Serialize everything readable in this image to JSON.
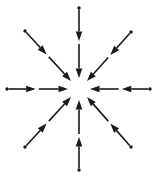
{
  "figure": {
    "width": 156,
    "height": 178,
    "background_color": "#ffffff",
    "stroke_color": "#1a1a1a",
    "arrow_count": 8
  },
  "chart_data": {
    "type": "diagram",
    "center": {
      "x": 79,
      "y": 89
    },
    "arrow_structure": {
      "tail_marker": "dot",
      "mid_shaft_arrowhead": true,
      "shaft_gap_after_mid_head": true,
      "terminal_arrowhead_at_center": true,
      "direction": "inward"
    },
    "arrows": [
      {
        "name": "arrow-north",
        "label": "N",
        "angle_deg": 90,
        "tail": {
          "x": 79,
          "y": 8
        },
        "tip": {
          "x": 79,
          "y": 78
        },
        "mid_head_t": 0.47
      },
      {
        "name": "arrow-northeast",
        "label": "NE",
        "angle_deg": 45,
        "tail": {
          "x": 131,
          "y": 32
        },
        "tip": {
          "x": 87,
          "y": 81
        },
        "mid_head_t": 0.47
      },
      {
        "name": "arrow-east",
        "label": "E",
        "angle_deg": 0,
        "tail": {
          "x": 150,
          "y": 89
        },
        "tip": {
          "x": 90,
          "y": 89
        },
        "mid_head_t": 0.47
      },
      {
        "name": "arrow-southeast",
        "label": "SE",
        "angle_deg": -45,
        "tail": {
          "x": 131,
          "y": 147
        },
        "tip": {
          "x": 87,
          "y": 97
        },
        "mid_head_t": 0.47
      },
      {
        "name": "arrow-south",
        "label": "S",
        "angle_deg": -90,
        "tail": {
          "x": 79,
          "y": 170
        },
        "tip": {
          "x": 79,
          "y": 100
        },
        "mid_head_t": 0.47
      },
      {
        "name": "arrow-southwest",
        "label": "SW",
        "angle_deg": -135,
        "tail": {
          "x": 25,
          "y": 147
        },
        "tip": {
          "x": 71,
          "y": 97
        },
        "mid_head_t": 0.47
      },
      {
        "name": "arrow-west",
        "label": "W",
        "angle_deg": 180,
        "tail": {
          "x": 7,
          "y": 89
        },
        "tip": {
          "x": 68,
          "y": 89
        },
        "mid_head_t": 0.47
      },
      {
        "name": "arrow-northwest",
        "label": "NW",
        "angle_deg": 135,
        "tail": {
          "x": 25,
          "y": 31
        },
        "tip": {
          "x": 71,
          "y": 81
        },
        "mid_head_t": 0.47
      }
    ]
  }
}
